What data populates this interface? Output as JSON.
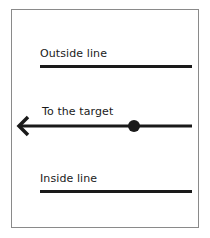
{
  "diagram": {
    "outside_line": {
      "label": "Outside line"
    },
    "target_line": {
      "label": "To the target",
      "arrow_direction": "left",
      "marker": "dot"
    },
    "inside_line": {
      "label": "Inside line"
    },
    "colors": {
      "line": "#1a1a1a",
      "frame": "#8a8a8a",
      "background": "#ffffff"
    }
  }
}
